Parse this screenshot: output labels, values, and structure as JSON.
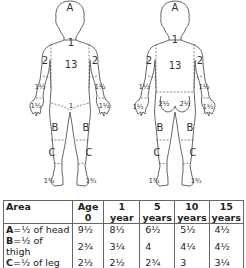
{
  "front_figure": {
    "labels": {
      "head": "A",
      "neck": "1",
      "trunk": "13",
      "upper_arm_left": "2",
      "upper_arm_right": "2",
      "forearm_left": "1½",
      "forearm_right": "1½",
      "hand_left": "1½",
      "hand_right": "1½",
      "genitals": "1",
      "thigh_left": "B",
      "thigh_right": "B",
      "leg_left": "C",
      "leg_right": "C",
      "foot_left": "1¾",
      "foot_right": "1¾"
    }
  },
  "back_figure": {
    "labels": {
      "head": "A",
      "neck": "1",
      "trunk": "13",
      "upper_arm_left": "2",
      "upper_arm_right": "2",
      "forearm_left": "1½",
      "forearm_right": "1½",
      "hand_left": "1½",
      "hand_right": "1½",
      "buttock_left": "2½",
      "buttock_right": "2½",
      "thigh_left": "B",
      "thigh_right": "B",
      "leg_left": "C",
      "leg_right": "C",
      "foot_left": "1¾",
      "foot_right": "1¾"
    }
  },
  "table": {
    "headers": {
      "area": "Area",
      "cols": [
        {
          "top": "Age",
          "bottom": "0"
        },
        {
          "top": "1",
          "bottom": "year"
        },
        {
          "top": "5",
          "bottom": "years"
        },
        {
          "top": "10",
          "bottom": "years"
        },
        {
          "top": "15",
          "bottom": "years"
        }
      ]
    },
    "rows": [
      {
        "key": "A",
        "desc": "=½ of head",
        "values": [
          "9½",
          "8½",
          "6½",
          "5½",
          "4½"
        ]
      },
      {
        "key": "B",
        "desc": "=½ of thigh",
        "values": [
          "2¾",
          "3¼",
          "4",
          "4¼",
          "4½"
        ]
      },
      {
        "key": "C",
        "desc": "=½ of leg",
        "values": [
          "2½",
          "2½",
          "2¾",
          "3",
          "3¼"
        ]
      }
    ]
  }
}
